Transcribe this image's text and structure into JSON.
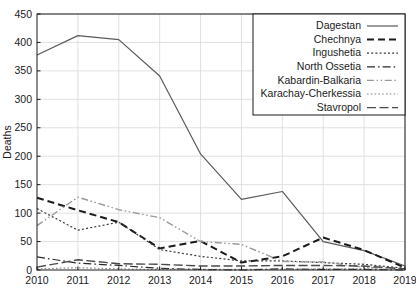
{
  "chart_data": {
    "type": "line",
    "title": "",
    "xlabel": "",
    "ylabel": "Deaths",
    "x": [
      2010,
      2011,
      2012,
      2013,
      2014,
      2015,
      2016,
      2017,
      2018,
      2019
    ],
    "xtick_labels": [
      "2010",
      "2011",
      "2012",
      "2013",
      "2014",
      "2015",
      "2016",
      "2017",
      "2018",
      "2019"
    ],
    "ytick_labels": [
      "0",
      "50",
      "100",
      "150",
      "200",
      "250",
      "300",
      "350",
      "400",
      "450"
    ],
    "yticks": [
      0,
      50,
      100,
      150,
      200,
      250,
      300,
      350,
      400,
      450
    ],
    "ylim": [
      0,
      450
    ],
    "xlim": [
      2010,
      2019
    ],
    "grid": true,
    "legend_position": "top-right",
    "series": [
      {
        "name": "Dagestan",
        "style": "solid",
        "color": "#5a5a5a",
        "width": 1.2,
        "values": [
          378,
          412,
          405,
          341,
          204,
          124,
          138,
          50,
          34,
          7
        ]
      },
      {
        "name": "Chechnya",
        "style": "dashed",
        "color": "#1a1a1a",
        "width": 2.0,
        "values": [
          127,
          105,
          84,
          38,
          51,
          13,
          24,
          57,
          35,
          4
        ]
      },
      {
        "name": "Ingushetia",
        "style": "dotted",
        "color": "#3a3a3a",
        "width": 1.2,
        "values": [
          108,
          70,
          84,
          36,
          24,
          16,
          16,
          13,
          10,
          3
        ]
      },
      {
        "name": "North Ossetia",
        "style": "dashdot",
        "color": "#2a2a2a",
        "width": 1.2,
        "values": [
          23,
          12,
          8,
          3,
          1,
          0,
          2,
          1,
          1,
          0
        ]
      },
      {
        "name": "Kabardin-Balkaria",
        "style": "dashdotdot",
        "color": "#9a9a9a",
        "width": 1.4,
        "values": [
          78,
          128,
          106,
          92,
          50,
          45,
          15,
          14,
          5,
          2
        ]
      },
      {
        "name": "Karachay-Cherkessia",
        "style": "fine-dotted",
        "color": "#8a8a8a",
        "width": 1.2,
        "values": [
          2,
          4,
          2,
          1,
          1,
          1,
          1,
          2,
          2,
          1
        ]
      },
      {
        "name": "Stavropol",
        "style": "long-dashed",
        "color": "#4a4a4a",
        "width": 1.4,
        "values": [
          5,
          18,
          11,
          10,
          7,
          7,
          8,
          8,
          7,
          2
        ]
      }
    ]
  },
  "plot": {
    "left": 37,
    "top": 14,
    "right": 405,
    "bottom": 270,
    "background": "#ffffff",
    "frame_color": "#1a1a1a",
    "grid_color": "#d8d8d8"
  },
  "legend": {
    "box_x": 253,
    "box_y": 14,
    "box_w": 152,
    "box_h": 101,
    "entries": [
      {
        "label": "Dagestan",
        "style": "solid"
      },
      {
        "label": "Chechnya",
        "style": "dashed"
      },
      {
        "label": "Ingushetia",
        "style": "dotted"
      },
      {
        "label": "North Ossetia",
        "style": "dashdot"
      },
      {
        "label": "Kabardin-Balkaria",
        "style": "dashdotdot"
      },
      {
        "label": "Karachay-Cherkessia",
        "style": "fine-dotted"
      },
      {
        "label": "Stavropol",
        "style": "long-dashed"
      }
    ]
  }
}
